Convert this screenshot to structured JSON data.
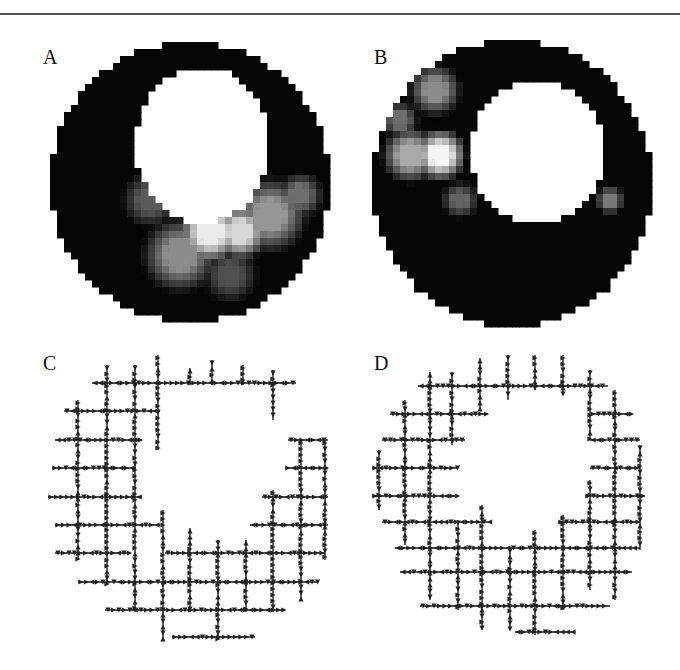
{
  "figure": {
    "panels": [
      {
        "id": "A",
        "label": "A",
        "kind": "intensity-map",
        "description": "short-axis ring, bright region inferior/inferolateral"
      },
      {
        "id": "B",
        "label": "B",
        "kind": "intensity-map",
        "description": "short-axis ring, bright region septal/anterior-septal, small spot lateral"
      },
      {
        "id": "C",
        "label": "C",
        "kind": "vector-grid"
      },
      {
        "id": "D",
        "kind": "vector-grid",
        "label": "D"
      }
    ],
    "colors": {
      "ring": "#050505",
      "bright": "#f2f2f2",
      "mid": "#9a9a9a",
      "arrow": "#222222",
      "rule": "#555555"
    }
  },
  "panelA": {
    "center": [
      190,
      182
    ],
    "outer_r": [
      140,
      140
    ],
    "inner_center": [
      202,
      145
    ],
    "inner_r": [
      67,
      78
    ],
    "blobs": [
      {
        "cx": 210,
        "cy": 232,
        "r": 34,
        "v": 235
      },
      {
        "cx": 240,
        "cy": 232,
        "r": 30,
        "v": 215
      },
      {
        "cx": 270,
        "cy": 215,
        "r": 40,
        "v": 150
      },
      {
        "cx": 180,
        "cy": 255,
        "r": 40,
        "v": 140
      },
      {
        "cx": 150,
        "cy": 200,
        "r": 30,
        "v": 90
      },
      {
        "cx": 300,
        "cy": 195,
        "r": 25,
        "v": 110
      },
      {
        "cx": 230,
        "cy": 275,
        "r": 30,
        "v": 80
      }
    ]
  },
  "panelB": {
    "center": [
      512,
      183
    ],
    "outer_r": [
      140,
      143
    ],
    "inner_center": [
      537,
      152
    ],
    "inner_r": [
      67,
      72
    ],
    "blobs": [
      {
        "cx": 440,
        "cy": 155,
        "r": 28,
        "v": 245
      },
      {
        "cx": 410,
        "cy": 155,
        "r": 30,
        "v": 170
      },
      {
        "cx": 435,
        "cy": 90,
        "r": 28,
        "v": 140
      },
      {
        "cx": 400,
        "cy": 120,
        "r": 20,
        "v": 110
      },
      {
        "cx": 460,
        "cy": 200,
        "r": 20,
        "v": 100
      },
      {
        "cx": 610,
        "cy": 200,
        "r": 16,
        "v": 120
      }
    ]
  },
  "panelC": {
    "step": 28,
    "h_lines": [
      {
        "y": 383,
        "x0": 92,
        "x1": 296
      },
      {
        "y": 411,
        "x0": 64,
        "x1": 160
      },
      {
        "y": 440,
        "x0": 55,
        "x1": 142
      },
      {
        "y": 440,
        "x0": 288,
        "x1": 328
      },
      {
        "y": 468,
        "x0": 52,
        "x1": 136
      },
      {
        "y": 468,
        "x0": 285,
        "x1": 328
      },
      {
        "y": 497,
        "x0": 48,
        "x1": 142
      },
      {
        "y": 497,
        "x0": 262,
        "x1": 328
      },
      {
        "y": 525,
        "x0": 55,
        "x1": 160
      },
      {
        "y": 525,
        "x0": 250,
        "x1": 328
      },
      {
        "y": 553,
        "x0": 55,
        "x1": 130
      },
      {
        "y": 553,
        "x0": 165,
        "x1": 325
      },
      {
        "y": 582,
        "x0": 78,
        "x1": 318
      },
      {
        "y": 610,
        "x0": 105,
        "x1": 285
      },
      {
        "y": 637,
        "x0": 172,
        "x1": 255
      }
    ],
    "v_lines": [
      {
        "x": 78,
        "y0": 400,
        "y1": 560
      },
      {
        "x": 107,
        "y0": 365,
        "y1": 585
      },
      {
        "x": 135,
        "y0": 365,
        "y1": 612
      },
      {
        "x": 158,
        "y0": 355,
        "y1": 450
      },
      {
        "x": 163,
        "y0": 510,
        "y1": 640
      },
      {
        "x": 190,
        "y0": 368,
        "y1": 385
      },
      {
        "x": 190,
        "y0": 528,
        "y1": 612
      },
      {
        "x": 212,
        "y0": 360,
        "y1": 385
      },
      {
        "x": 218,
        "y0": 540,
        "y1": 640
      },
      {
        "x": 243,
        "y0": 365,
        "y1": 385
      },
      {
        "x": 246,
        "y0": 540,
        "y1": 612
      },
      {
        "x": 273,
        "y0": 370,
        "y1": 420
      },
      {
        "x": 273,
        "y0": 490,
        "y1": 612
      },
      {
        "x": 301,
        "y0": 440,
        "y1": 600
      },
      {
        "x": 325,
        "y0": 440,
        "y1": 560
      }
    ]
  },
  "panelD": {
    "step": 28,
    "h_lines": [
      {
        "y": 386,
        "x0": 418,
        "x1": 608
      },
      {
        "y": 414,
        "x0": 390,
        "x1": 488
      },
      {
        "y": 414,
        "x0": 590,
        "x1": 632
      },
      {
        "y": 440,
        "x0": 382,
        "x1": 465
      },
      {
        "y": 440,
        "x0": 590,
        "x1": 612
      },
      {
        "y": 440,
        "x0": 612,
        "x1": 640
      },
      {
        "y": 468,
        "x0": 372,
        "x1": 458
      },
      {
        "y": 468,
        "x0": 590,
        "x1": 640
      },
      {
        "y": 496,
        "x0": 372,
        "x1": 458
      },
      {
        "y": 496,
        "x0": 585,
        "x1": 645
      },
      {
        "y": 522,
        "x0": 382,
        "x1": 490
      },
      {
        "y": 522,
        "x0": 558,
        "x1": 640
      },
      {
        "y": 548,
        "x0": 395,
        "x1": 640
      },
      {
        "y": 572,
        "x0": 400,
        "x1": 632
      },
      {
        "y": 606,
        "x0": 420,
        "x1": 610
      },
      {
        "y": 632,
        "x0": 515,
        "x1": 575
      }
    ],
    "v_lines": [
      {
        "x": 379,
        "y0": 450,
        "y1": 510
      },
      {
        "x": 405,
        "y0": 400,
        "y1": 545
      },
      {
        "x": 430,
        "y0": 372,
        "y1": 600
      },
      {
        "x": 452,
        "y0": 372,
        "y1": 445
      },
      {
        "x": 458,
        "y0": 520,
        "y1": 610
      },
      {
        "x": 480,
        "y0": 358,
        "y1": 410
      },
      {
        "x": 482,
        "y0": 505,
        "y1": 630
      },
      {
        "x": 508,
        "y0": 355,
        "y1": 400
      },
      {
        "x": 510,
        "y0": 548,
        "y1": 630
      },
      {
        "x": 535,
        "y0": 355,
        "y1": 390
      },
      {
        "x": 535,
        "y0": 530,
        "y1": 635
      },
      {
        "x": 563,
        "y0": 355,
        "y1": 395
      },
      {
        "x": 563,
        "y0": 515,
        "y1": 610
      },
      {
        "x": 590,
        "y0": 370,
        "y1": 440
      },
      {
        "x": 590,
        "y0": 480,
        "y1": 590
      },
      {
        "x": 615,
        "y0": 390,
        "y1": 600
      },
      {
        "x": 640,
        "y0": 445,
        "y1": 550
      }
    ]
  }
}
